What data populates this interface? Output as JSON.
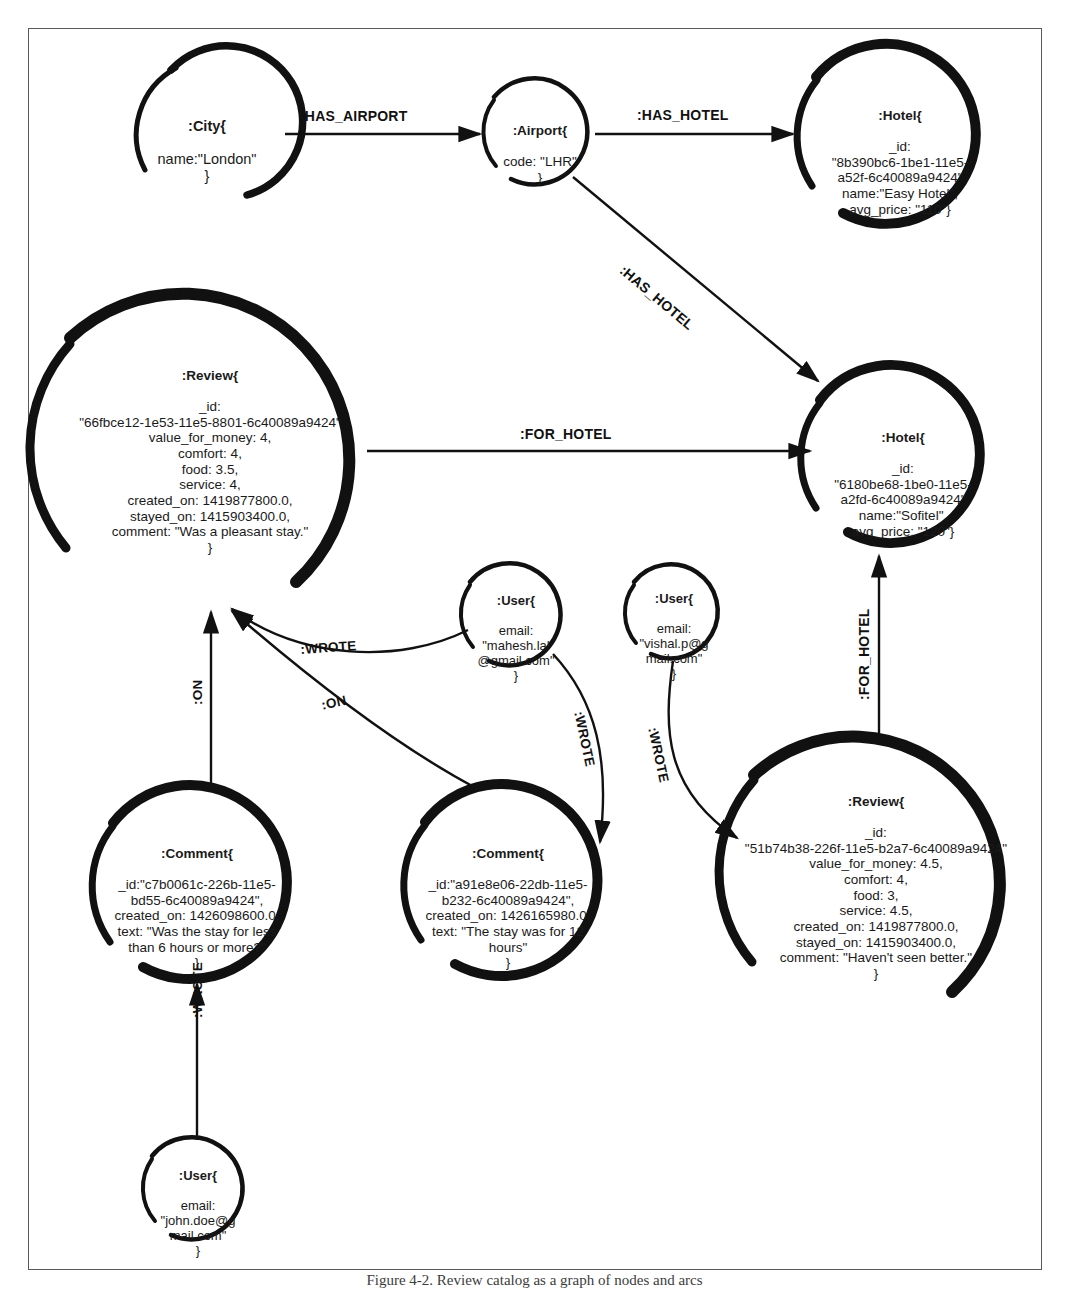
{
  "figure": {
    "caption": "Figure 4-2. Review catalog as a graph of nodes and arcs",
    "border_color": "#5a5a5a",
    "ink_color": "#111111"
  },
  "nodes": [
    {
      "id": "city-london",
      "name": "node-city-london",
      "title": ":City{",
      "body": "name:\"London\"\n}",
      "cx": 207,
      "cy": 131,
      "r": 76,
      "stroke": 7,
      "font_size": 14.5
    },
    {
      "id": "airport-lhr",
      "name": "node-airport-lhr",
      "title": ":Airport{",
      "body": "code: \"LHR\"\n}",
      "cx": 540,
      "cy": 133,
      "r": 53,
      "stroke": 4.5,
      "font_size": 13.5
    },
    {
      "id": "hotel-easy",
      "name": "node-hotel-easy",
      "title": ":Hotel{",
      "body": "_id:\n\"8b390bc6-1be1-11e5-\na52f-6c40089a9424\"\nname:\"Easy Hotel\",\navg_price: \"110\"}",
      "cx": 900,
      "cy": 137,
      "r": 90,
      "stroke": 9,
      "font_size": 13.5
    },
    {
      "id": "review-pleasant",
      "name": "node-review-pleasant",
      "title": ":Review{",
      "body": "_id:\n\"66fbce12-1e53-11e5-8801-6c40089a9424\"\nvalue_for_money: 4,\ncomfort: 4,\nfood: 3.5,\nservice: 4,\ncreated_on: 1419877800.0,\nstayed_on: 1415903400.0,\ncomment: \"Was a pleasant stay.\"\n}",
      "cx": 210,
      "cy": 450,
      "r": 156,
      "stroke": 11,
      "font_size": 13.5
    },
    {
      "id": "hotel-sofitel",
      "name": "node-hotel-sofitel",
      "title": ":Hotel{",
      "body": "_id:\n\"6180be68-1be0-11e5-\na2fd-6c40089a9424\"\nname:\"Sofitel\",\navg_price: \"120\"}",
      "cx": 903,
      "cy": 459,
      "r": 89,
      "stroke": 9,
      "font_size": 13.5
    },
    {
      "id": "user-mahesh",
      "name": "node-user-mahesh",
      "title": ":User{",
      "body": "email:\n\"mahesh.lal\n@gmail.com\"\n}",
      "cx": 516,
      "cy": 616,
      "r": 51,
      "stroke": 4.5,
      "font_size": 13
    },
    {
      "id": "user-vishal",
      "name": "node-user-vishal",
      "title": ":User{",
      "body": "email:\n\"vishal.p@g\nmail.com\"\n}",
      "cx": 674,
      "cy": 613,
      "r": 47,
      "stroke": 4.5,
      "font_size": 13
    },
    {
      "id": "comment-6hours",
      "name": "node-comment-six-hours",
      "title": ":Comment{",
      "body": "_id:\"c7b0061c-226b-11e5-\nbd55-6c40089a9424\",\ncreated_on: 1426098600.0,\ntext: \"Was the stay for less\nthan 6 hours or more?\"\n}",
      "cx": 197,
      "cy": 886,
      "r": 97,
      "stroke": 9,
      "font_size": 13.5
    },
    {
      "id": "comment-12hours",
      "name": "node-comment-twelve-hours",
      "title": ":Comment{",
      "body": "_id:\"a91e8e06-22db-11e5-\nb232-6c40089a9424\",\ncreated_on: 1426165980.0,\ntext: \"The stay was for 12\nhours\"\n}",
      "cx": 508,
      "cy": 884,
      "r": 96,
      "stroke": 9,
      "font_size": 13.5
    },
    {
      "id": "review-better",
      "name": "node-review-better",
      "title": ":Review{",
      "body": "_id:\n\"51b74b38-226f-11e5-b2a7-6c40089a9424\"\nvalue_for_money: 4.5,\ncomfort: 4,\nfood: 3,\nservice: 4.5,\ncreated_on: 1419877800.0,\nstayed_on: 1415903400.0,\ncomment: \"Haven't seen better.\"\n}",
      "cx": 876,
      "cy": 875,
      "r": 139,
      "stroke": 11,
      "font_size": 13.5
    },
    {
      "id": "user-john",
      "name": "node-user-john",
      "title": ":User{",
      "body": "email:\n\"john.doe@g\nmail.com\"\n}",
      "cx": 198,
      "cy": 1190,
      "r": 51,
      "stroke": 4.5,
      "font_size": 13
    }
  ],
  "edges": [
    {
      "id": "city-has-airport",
      "name": "edge-has-airport",
      "label": ":HAS_AIRPORT",
      "from": "city-london",
      "to": "airport-lhr",
      "label_x": 300,
      "label_y": 114,
      "rotate": 0,
      "font_size": 14
    },
    {
      "id": "airport-has-hotel-easy",
      "name": "edge-has-hotel-easy",
      "label": ":HAS_HOTEL",
      "from": "airport-lhr",
      "to": "hotel-easy",
      "label_x": 636,
      "label_y": 113,
      "rotate": 0,
      "font_size": 14
    },
    {
      "id": "airport-has-hotel-sofitel",
      "name": "edge-has-hotel-sofitel",
      "label": ":HAS_HOTEL",
      "from": "airport-lhr",
      "to": "hotel-sofitel",
      "label_x": 660,
      "label_y": 270,
      "rotate": 52,
      "font_size": 14
    },
    {
      "id": "review-for-hotel-sofitel",
      "name": "edge-for-hotel-top",
      "label": ":FOR_HOTEL",
      "from": "review-pleasant",
      "to": "hotel-sofitel",
      "label_x": 559,
      "label_y": 432,
      "rotate": 0,
      "font_size": 14
    },
    {
      "id": "review-better-for-hotel",
      "name": "edge-for-hotel-bottom",
      "label": ":FOR_HOTEL",
      "from": "review-better",
      "to": "hotel-sofitel",
      "label_x": 874,
      "label_y": 660,
      "rotate": -90,
      "font_size": 14
    },
    {
      "id": "mahesh-wrote-review",
      "name": "edge-wrote-review-pleasant",
      "label": ":WROTE",
      "from": "user-mahesh",
      "to": "review-pleasant",
      "label_x": 333,
      "label_y": 650,
      "rotate": -5,
      "font_size": 13.5
    },
    {
      "id": "comment-on-review-left",
      "name": "edge-on-review-left",
      "label": ":ON",
      "from": "comment-6hours",
      "to": "review-pleasant",
      "label_x": 196,
      "label_y": 687,
      "rotate": -90,
      "font_size": 13.5
    },
    {
      "id": "comment-on-review-right",
      "name": "edge-on-review-right",
      "label": ":ON",
      "from": "comment-12hours",
      "to": "review-pleasant",
      "label_x": 334,
      "label_y": 708,
      "rotate": -13,
      "font_size": 13.5
    },
    {
      "id": "mahesh-wrote-comment",
      "name": "edge-wrote-comment-twelve-hours",
      "label": ":WROTE",
      "from": "user-mahesh",
      "to": "comment-12hours",
      "label_x": 592,
      "label_y": 748,
      "rotate": -78,
      "font_size": 13.5
    },
    {
      "id": "vishal-wrote-review",
      "name": "edge-wrote-review-better",
      "label": ":WROTE",
      "from": "user-vishal",
      "to": "review-better",
      "label_x": 668,
      "label_y": 778,
      "rotate": -90,
      "font_size": 13.5
    },
    {
      "id": "john-wrote-comment",
      "name": "edge-wrote-comment-six-hours",
      "label": ":WROTE",
      "from": "user-john",
      "to": "comment-6hours",
      "label_x": 196,
      "label_y": 1065,
      "rotate": -90,
      "font_size": 13.5
    }
  ],
  "graph_summary": {
    "node_count": 11,
    "edge_count": 11,
    "labels": [
      ":City",
      ":Airport",
      ":Hotel",
      ":Review",
      ":Comment",
      ":User"
    ],
    "relationships": [
      ":HAS_AIRPORT",
      ":HAS_HOTEL",
      ":FOR_HOTEL",
      ":WROTE",
      ":ON"
    ]
  }
}
